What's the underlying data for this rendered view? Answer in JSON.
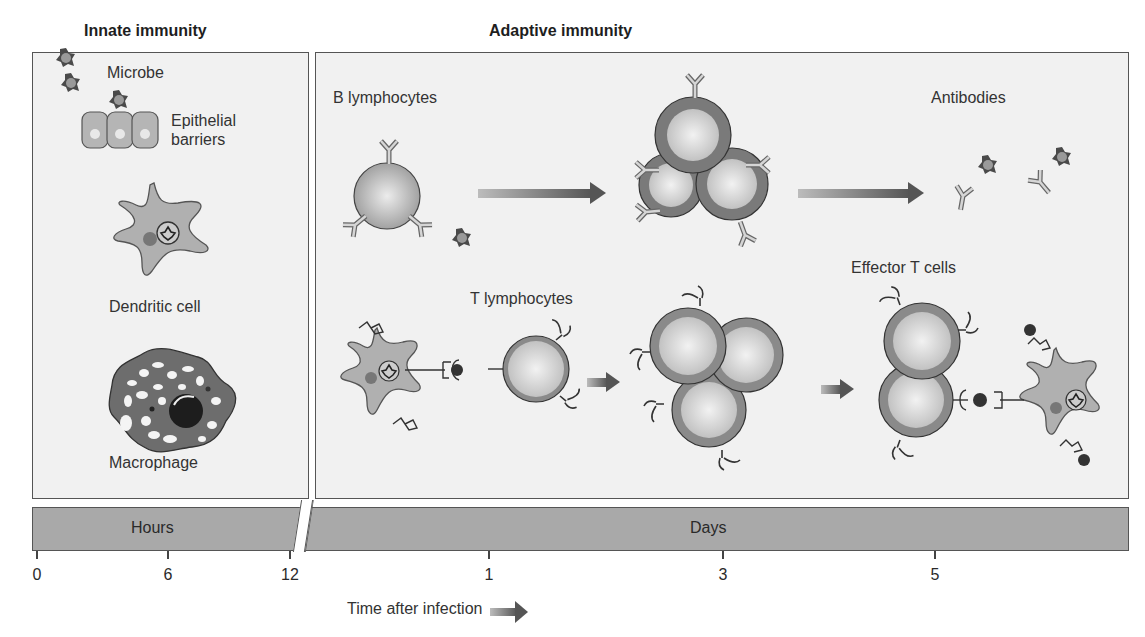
{
  "headings": {
    "innate": "Innate immunity",
    "adaptive": "Adaptive immunity"
  },
  "innate_panel": {
    "labels": {
      "microbe": "Microbe",
      "epithelial_line1": "Epithelial",
      "epithelial_line2": "barriers",
      "dendritic": "Dendritic cell",
      "macrophage": "Macrophage"
    }
  },
  "adaptive_panel": {
    "labels": {
      "b_lymphocytes": "B lymphocytes",
      "antibodies": "Antibodies",
      "t_lymphocytes": "T lymphocytes",
      "effector_t": "Effector T cells"
    }
  },
  "timeline": {
    "hours_label": "Hours",
    "days_label": "Days",
    "ticks": [
      {
        "label": "0",
        "x": 37
      },
      {
        "label": "6",
        "x": 168
      },
      {
        "label": "12",
        "x": 290
      },
      {
        "label": "1",
        "x": 489
      },
      {
        "label": "3",
        "x": 723
      },
      {
        "label": "5",
        "x": 935
      }
    ],
    "axis_title": "Time after infection"
  },
  "colors": {
    "panel_bg": "#f1f1f1",
    "bar_fill": "#a9a9a9",
    "cell_fill": "#b8b8b8",
    "ring": "#8a8a8a",
    "dark": "#3a3a3a"
  }
}
